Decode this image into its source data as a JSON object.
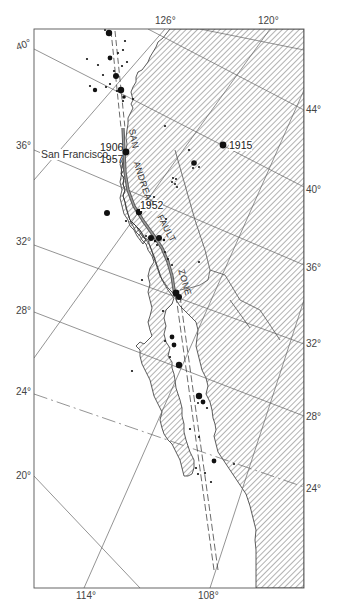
{
  "map": {
    "subject": "San Andreas Fault Zone earthquake epicenters",
    "colors": {
      "background": "#ffffff",
      "land_hatch": "#555555",
      "grid_line": "#666666",
      "coastline": "#333333",
      "fault": "#777777",
      "epicenter": "#111111",
      "frame": "#555555"
    },
    "longitude_labels_top": [
      {
        "text": "126°",
        "x": 155,
        "y": 16
      },
      {
        "text": "120°",
        "x": 258,
        "y": 16
      }
    ],
    "longitude_labels_bottom": [
      {
        "text": "114°",
        "x": 76,
        "y": 591
      },
      {
        "text": "108°",
        "x": 198,
        "y": 591
      }
    ],
    "latitude_labels_left": [
      {
        "text": "40°",
        "x": 16,
        "y": 40
      },
      {
        "text": "36°",
        "x": 16,
        "y": 141
      },
      {
        "text": "32°",
        "x": 16,
        "y": 237
      },
      {
        "text": "28°",
        "x": 16,
        "y": 306
      },
      {
        "text": "24°",
        "x": 16,
        "y": 387
      },
      {
        "text": "20°",
        "x": 16,
        "y": 471
      }
    ],
    "latitude_labels_right": [
      {
        "text": "44°",
        "x": 306,
        "y": 105
      },
      {
        "text": "40°",
        "x": 306,
        "y": 185
      },
      {
        "text": "36°",
        "x": 306,
        "y": 263
      },
      {
        "text": "32°",
        "x": 306,
        "y": 339
      },
      {
        "text": "28°",
        "x": 306,
        "y": 412
      },
      {
        "text": "24°",
        "x": 306,
        "y": 484
      }
    ],
    "place_labels": [
      {
        "text": "San Francisco",
        "x": 40,
        "y": 149
      }
    ],
    "year_labels": [
      {
        "text": "1906",
        "x": 100,
        "y": 142
      },
      {
        "text": "1957",
        "x": 100,
        "y": 154
      },
      {
        "text": "1952",
        "x": 140,
        "y": 200
      },
      {
        "text": "1915",
        "x": 229,
        "y": 140
      }
    ],
    "fault_label": {
      "words": [
        "SAN",
        "ANDREAS",
        "FAULT",
        "ZONE"
      ]
    }
  }
}
